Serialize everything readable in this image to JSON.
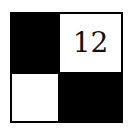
{
  "puzzle": {
    "rows": 2,
    "cols": 2,
    "cells": [
      {
        "row": 0,
        "col": 0,
        "color": "black",
        "number": ""
      },
      {
        "row": 0,
        "col": 1,
        "color": "white",
        "number": "12"
      },
      {
        "row": 1,
        "col": 0,
        "color": "white",
        "number": ""
      },
      {
        "row": 1,
        "col": 1,
        "color": "black",
        "number": ""
      }
    ]
  }
}
